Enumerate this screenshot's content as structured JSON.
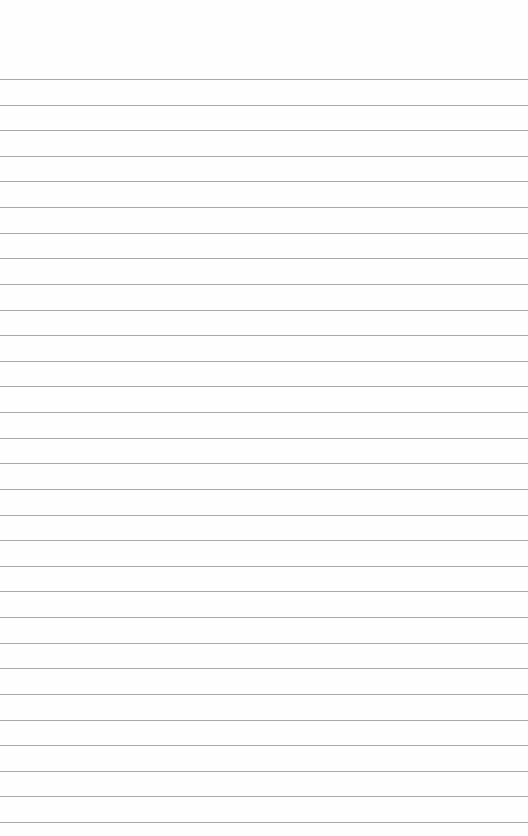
{
  "page": {
    "type": "lined-paper",
    "line_count": 30,
    "first_line_y": 79,
    "line_spacing": 25.62,
    "line_color": "#a9a9a9",
    "background_color": "#fefefe"
  }
}
